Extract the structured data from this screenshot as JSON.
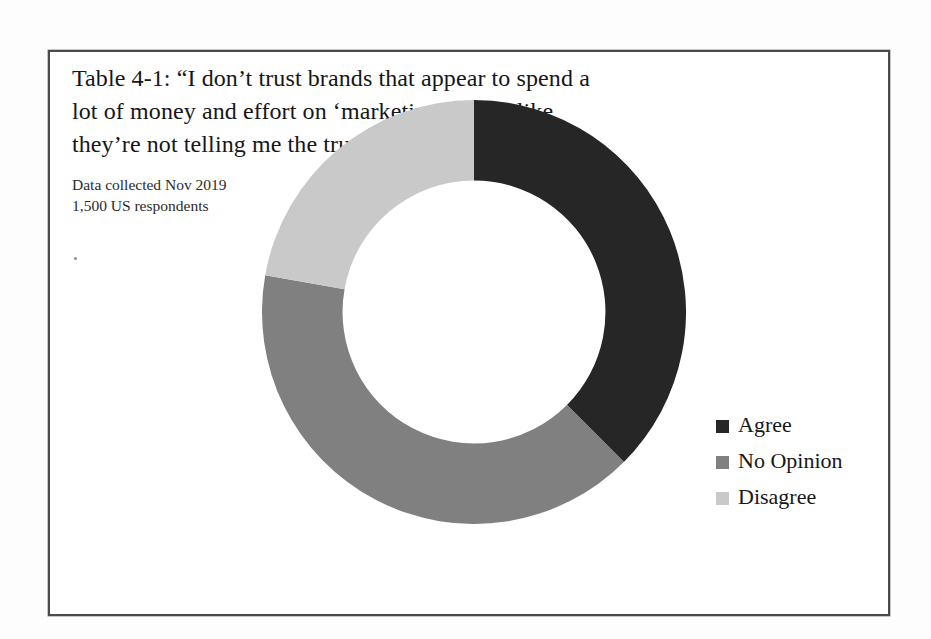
{
  "figure": {
    "caption": "Table 4-1: “I don’t trust brands that appear to spend a lot of money and effort on ‘marketing’; I feel like they’re not telling me the truth.”",
    "source_line_1": "Data collected Nov 2019",
    "source_line_2": "1,500 US respondents"
  },
  "chart_data": {
    "type": "pie",
    "variant": "donut",
    "title": "Table 4-1: “I don’t trust brands that appear to spend a lot of money and effort on ‘marketing’; I feel like they’re not telling me the truth.”",
    "subtitle": "Data collected Nov 2019 / 1,500 US respondents",
    "categories": [
      "Agree",
      "No Opinion",
      "Disagree"
    ],
    "values": [
      37.5,
      40.3,
      22.2
    ],
    "units": "percent",
    "start_angle_deg": 0,
    "direction": "clockwise",
    "hole_ratio": 0.62,
    "colors": [
      "#262626",
      "#808080",
      "#c9c9c9"
    ],
    "legend_position": "right",
    "grid": false,
    "slices": [
      {
        "label": "Agree",
        "value": 37.5,
        "color": "#262626",
        "angle_start_deg": 0,
        "angle_end_deg": 135
      },
      {
        "label": "No Opinion",
        "value": 40.3,
        "color": "#808080",
        "angle_start_deg": 135,
        "angle_end_deg": 280
      },
      {
        "label": "Disagree",
        "value": 22.2,
        "color": "#c9c9c9",
        "angle_start_deg": 280,
        "angle_end_deg": 360
      }
    ]
  },
  "legend": {
    "items": [
      {
        "label": "Agree",
        "color": "#262626"
      },
      {
        "label": "No Opinion",
        "color": "#808080"
      },
      {
        "label": "Disagree",
        "color": "#c9c9c9"
      }
    ]
  },
  "style": {
    "frame_border_color": "#4a4a4a",
    "page_background": "#fdfdfd",
    "text_color": "#161616"
  }
}
